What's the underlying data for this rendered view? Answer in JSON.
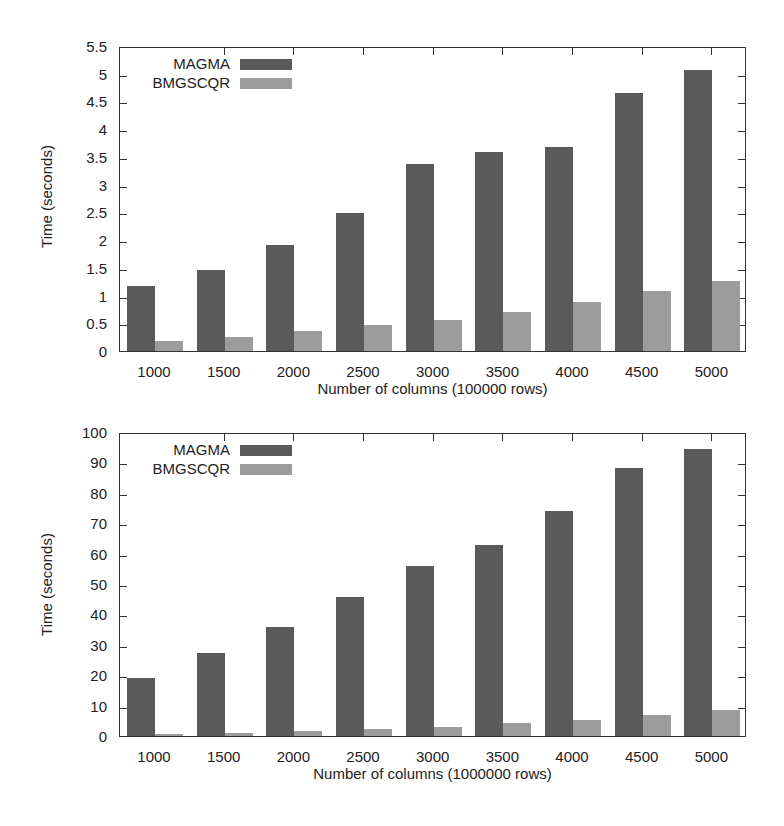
{
  "colors": {
    "magma": "#5a5a5a",
    "bmgscqr": "#9c9c9c"
  },
  "chart_data": [
    {
      "type": "bar",
      "title": "",
      "xlabel": "Number of columns (100000 rows)",
      "ylabel": "Time (seconds)",
      "ylim": [
        0,
        5.5
      ],
      "yticks": [
        "0",
        "0.5",
        "1",
        "1.5",
        "2",
        "2.5",
        "3",
        "3.5",
        "4",
        "4.5",
        "5",
        "5.5"
      ],
      "categories": [
        "1000",
        "1500",
        "2000",
        "2500",
        "3000",
        "3500",
        "4000",
        "4500",
        "5000"
      ],
      "legend_position": "top-left",
      "series": [
        {
          "name": "MAGMA",
          "values": [
            1.17,
            1.46,
            1.91,
            2.49,
            3.37,
            3.59,
            3.68,
            4.65,
            5.07
          ]
        },
        {
          "name": "BMGSCQR",
          "values": [
            0.18,
            0.25,
            0.36,
            0.47,
            0.56,
            0.7,
            0.88,
            1.08,
            1.26
          ]
        }
      ]
    },
    {
      "type": "bar",
      "title": "",
      "xlabel": "Number of columns (1000000 rows)",
      "ylabel": "Time (seconds)",
      "ylim": [
        0,
        100
      ],
      "yticks": [
        "0",
        "10",
        "20",
        "30",
        "40",
        "50",
        "60",
        "70",
        "80",
        "90",
        "100"
      ],
      "categories": [
        "1000",
        "1500",
        "2000",
        "2500",
        "3000",
        "3500",
        "4000",
        "4500",
        "5000"
      ],
      "legend_position": "top-left",
      "series": [
        {
          "name": "MAGMA",
          "values": [
            19.1,
            27.3,
            35.9,
            45.7,
            55.9,
            62.8,
            74.0,
            88.2,
            94.4
          ]
        },
        {
          "name": "BMGSCQR",
          "values": [
            0.6,
            1.0,
            1.5,
            2.2,
            3.0,
            4.3,
            5.3,
            6.9,
            8.6
          ]
        }
      ]
    }
  ]
}
